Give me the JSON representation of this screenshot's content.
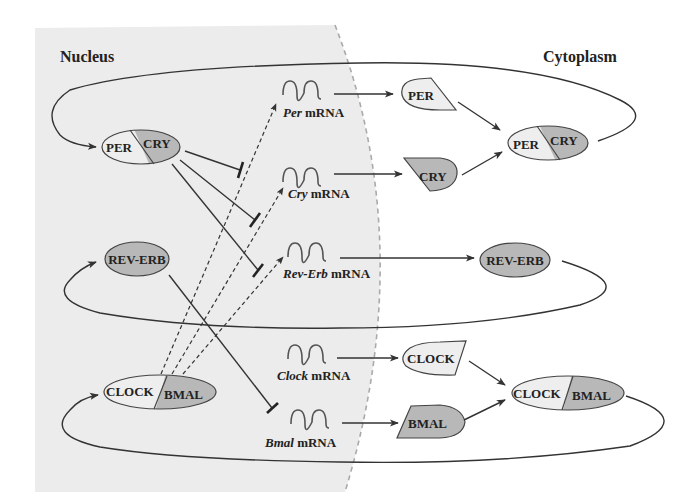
{
  "regions": {
    "nucleus": {
      "label": "Nucleus"
    },
    "cytoplasm": {
      "label": "Cytoplasm"
    }
  },
  "colors": {
    "nucleus_bg": "#ececec",
    "light_fill": "#eeeeee",
    "dark_fill": "#b8b8b8",
    "line": "#333333",
    "boundary": "#aaaaaa"
  },
  "nucleus_proteins": {
    "per_cry": {
      "left": "PER",
      "right": "CRY"
    },
    "rev_erb": {
      "label": "REV-ERB"
    },
    "clock_bmal": {
      "left": "CLOCK",
      "right": "BMAL"
    }
  },
  "mrnas": [
    {
      "gene": "Per",
      "suffix": " mRNA"
    },
    {
      "gene": "Cry",
      "suffix": " mRNA"
    },
    {
      "gene": "Rev-Erb",
      "suffix": " mRNA"
    },
    {
      "gene": "Clock",
      "suffix": " mRNA"
    },
    {
      "gene": "Bmal",
      "suffix": " mRNA"
    }
  ],
  "cytoplasm_proteins": {
    "per": "PER",
    "cry": "CRY",
    "rev_erb": "REV-ERB",
    "clock": "CLOCK",
    "bmal": "BMAL",
    "per_cry": {
      "left": "PER",
      "right": "CRY"
    },
    "clock_bmal": {
      "left": "CLOCK",
      "right": "BMAL"
    }
  },
  "relations": [
    {
      "from": "CLOCK/BMAL (nucleus)",
      "to": "Per mRNA",
      "type": "activation (dashed)"
    },
    {
      "from": "CLOCK/BMAL (nucleus)",
      "to": "Cry mRNA",
      "type": "activation (dashed)"
    },
    {
      "from": "CLOCK/BMAL (nucleus)",
      "to": "Rev-Erb mRNA",
      "type": "activation (dashed)"
    },
    {
      "from": "PER/CRY (nucleus)",
      "to": "Per activation",
      "type": "inhibition"
    },
    {
      "from": "PER/CRY (nucleus)",
      "to": "Cry activation",
      "type": "inhibition"
    },
    {
      "from": "PER/CRY (nucleus)",
      "to": "Rev-Erb activation",
      "type": "inhibition"
    },
    {
      "from": "REV-ERB (nucleus)",
      "to": "Bmal mRNA",
      "type": "inhibition"
    },
    {
      "from": "Per mRNA",
      "to": "PER",
      "type": "translation"
    },
    {
      "from": "Cry mRNA",
      "to": "CRY",
      "type": "translation"
    },
    {
      "from": "Rev-Erb mRNA",
      "to": "REV-ERB",
      "type": "translation"
    },
    {
      "from": "Clock mRNA",
      "to": "CLOCK",
      "type": "translation"
    },
    {
      "from": "Bmal mRNA",
      "to": "BMAL",
      "type": "translation"
    },
    {
      "from": "PER + CRY",
      "to": "PER/CRY (cytoplasm)",
      "type": "association"
    },
    {
      "from": "CLOCK + BMAL",
      "to": "CLOCK/BMAL (cytoplasm)",
      "type": "association"
    },
    {
      "from": "PER/CRY (cytoplasm)",
      "to": "PER/CRY (nucleus)",
      "type": "nuclear entry"
    },
    {
      "from": "REV-ERB (cytoplasm)",
      "to": "REV-ERB (nucleus)",
      "type": "nuclear entry"
    },
    {
      "from": "CLOCK/BMAL (cytoplasm)",
      "to": "CLOCK/BMAL (nucleus)",
      "type": "nuclear entry"
    }
  ]
}
